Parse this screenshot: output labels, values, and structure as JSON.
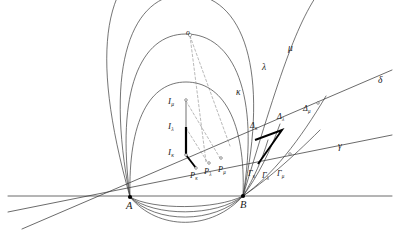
{
  "figure": {
    "background_color": "#ffffff",
    "stroke_color": "#3a3a3a",
    "bold_stroke_color": "#000000",
    "light_stroke_color": "#b8b8b8",
    "dash_color": "#8a8a8a",
    "label_color": "#1a1a1a"
  },
  "base_points": [
    {
      "name": "point-a",
      "label": "A",
      "x": 130,
      "y": 197,
      "lx": 126,
      "ly": 201
    },
    {
      "name": "point-b",
      "label": "B",
      "x": 243,
      "y": 196,
      "lx": 240,
      "ly": 200
    }
  ],
  "center_marker": {
    "name": "arc-center-marker",
    "label": "o",
    "x": 190,
    "y": 35,
    "lx": 186,
    "ly": 29
  },
  "curve_labels": [
    {
      "name": "curve-label-kappa",
      "label": "κ",
      "x": 236,
      "y": 88
    },
    {
      "name": "curve-label-lambda",
      "label": "λ",
      "x": 262,
      "y": 63
    },
    {
      "name": "curve-label-mu",
      "label": "μ",
      "x": 288,
      "y": 44
    },
    {
      "name": "curve-label-delta",
      "label": "δ",
      "x": 378,
      "y": 76
    },
    {
      "name": "curve-label-gamma",
      "label": "γ",
      "x": 338,
      "y": 142
    }
  ],
  "segment_labels": [
    {
      "name": "segment-label-i-mu",
      "base": "I",
      "sub": "μ",
      "x": 168,
      "y": 97
    },
    {
      "name": "segment-label-i-lambda",
      "base": "I",
      "sub": "λ",
      "x": 168,
      "y": 122
    },
    {
      "name": "segment-label-i-kappa",
      "base": "I",
      "sub": "κ",
      "x": 168,
      "y": 148
    }
  ],
  "foot_labels": [
    {
      "name": "foot-label-p-kappa",
      "base": "P",
      "sub": "κ",
      "x": 190,
      "y": 172
    },
    {
      "name": "foot-label-p-lambda",
      "base": "P",
      "sub": "λ",
      "x": 204,
      "y": 168
    },
    {
      "name": "foot-label-p-mu",
      "base": "P",
      "sub": "μ",
      "x": 218,
      "y": 166
    }
  ],
  "delta_labels": [
    {
      "name": "delta-label-kappa",
      "base": "Δ",
      "sub": "κ",
      "x": 250,
      "y": 122
    },
    {
      "name": "delta-label-lambda",
      "base": "Δ",
      "sub": "λ",
      "x": 277,
      "y": 113
    },
    {
      "name": "delta-label-mu",
      "base": "Δ",
      "sub": "μ",
      "x": 303,
      "y": 105
    }
  ],
  "gamma_labels": [
    {
      "name": "gamma-label-kappa",
      "base": "Γ",
      "sub": "κ",
      "x": 248,
      "y": 170
    },
    {
      "name": "gamma-label-lambda",
      "base": "Γ",
      "sub": "λ",
      "x": 262,
      "y": 172
    },
    {
      "name": "gamma-label-mu",
      "base": "Γ",
      "sub": "μ",
      "x": 277,
      "y": 170
    }
  ],
  "geometry": {
    "baseline": {
      "name": "baseline",
      "x1": 8,
      "y1": 196,
      "x2": 392,
      "y2": 196
    },
    "line_gamma": {
      "name": "line-gamma",
      "x1": 8,
      "y1": 212,
      "x2": 392,
      "y2": 135
    },
    "line_delta": {
      "name": "line-delta",
      "x1": 22,
      "y1": 229,
      "x2": 392,
      "y2": 70
    },
    "arcs_upper": [
      {
        "name": "arc-kappa",
        "d": "M 130 197 C 128 120 150 82 186 82 C 222 82 246 120 243 196"
      },
      {
        "name": "arc-lambda",
        "d": "M 130 197 C 116 92 140 34 186 34 C 234 34 260 96 243 196"
      },
      {
        "name": "arc-mu",
        "d": "M 130 197 C 104 64 132 -6 186 -6 C 244 -6 270 72 243 196"
      },
      {
        "name": "arc-outer-left",
        "d": "M 130 197 C 88 48 104 -30 168 -48"
      },
      {
        "name": "arc-outer-right",
        "d": "M 243 196 C 284 60 300 12 330 -22"
      }
    ],
    "arcs_lower": [
      {
        "name": "arc-lower-1",
        "d": "M 130 197 C 152 210 216 210 243 196"
      },
      {
        "name": "arc-lower-2",
        "d": "M 130 197 C 154 217 216 217 243 196"
      },
      {
        "name": "arc-lower-3",
        "d": "M 130 197 C 156 224 214 224 243 196"
      },
      {
        "name": "arc-lower-4",
        "d": "M 130 197 C 158 231 212 231 243 196"
      }
    ],
    "arcs_right_lower": [
      {
        "name": "arc-right-gamma",
        "d": "M 243 196 C 264 182 290 160 320 130"
      },
      {
        "name": "arc-right-delta",
        "d": "M 243 196 C 272 176 300 140 326 96"
      },
      {
        "name": "arc-right-inner-1",
        "d": "M 243 196 C 254 178 262 160 268 140"
      },
      {
        "name": "arc-right-inner-2",
        "d": "M 243 196 C 258 176 270 152 280 124"
      }
    ],
    "vertical_segment": {
      "name": "vertical-segment-i",
      "x": 186,
      "y_top": 100,
      "y_mid": 127,
      "y_bottom": 155,
      "light_part": {
        "y1": 100,
        "y2": 127
      },
      "bold_part": {
        "y1": 127,
        "y2": 155
      }
    },
    "bold_polyline": {
      "name": "bold-right-angle-marker",
      "points": "255 140 282 130 282 130 258 164"
    },
    "dashed_lines": [
      {
        "name": "dashed-center-to-foot-1",
        "x1": 190,
        "y1": 36,
        "x2": 206,
        "y2": 162
      },
      {
        "name": "dashed-center-to-foot-2",
        "x1": 190,
        "y1": 36,
        "x2": 230,
        "y2": 146
      },
      {
        "name": "dashed-i-to-p-1",
        "x1": 186,
        "y1": 155,
        "x2": 196,
        "y2": 168
      },
      {
        "name": "dashed-i-to-p-2",
        "x1": 186,
        "y1": 128,
        "x2": 208,
        "y2": 163
      },
      {
        "name": "dashed-i-to-p-3",
        "x1": 186,
        "y1": 101,
        "x2": 220,
        "y2": 158
      }
    ],
    "markers": [
      {
        "name": "marker-i-top",
        "x": 186,
        "y": 100
      },
      {
        "name": "marker-i-bottom",
        "x": 186,
        "y": 155
      },
      {
        "name": "marker-p-kappa",
        "x": 196,
        "y": 168
      },
      {
        "name": "marker-p-lambda",
        "x": 209,
        "y": 163
      },
      {
        "name": "marker-p-mu",
        "x": 221,
        "y": 158
      },
      {
        "name": "marker-delta-mu",
        "x": 318,
        "y": 103
      },
      {
        "name": "marker-gamma-mu",
        "x": 290,
        "y": 154
      }
    ]
  }
}
